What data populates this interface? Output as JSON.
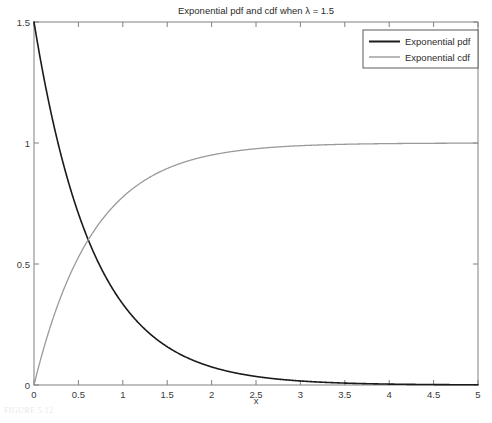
{
  "figure": {
    "caption": "FIGURE 5.12",
    "background_color": "#ffffff"
  },
  "chart_data": {
    "type": "line",
    "title": "Exponential pdf and cdf when λ = 1.5",
    "xlabel": "x",
    "ylabel": "",
    "xlim": [
      0,
      5
    ],
    "ylim": [
      0,
      1.5
    ],
    "grid": false,
    "legend_position": "top-right",
    "lambda": 1.5,
    "xticks": [
      0,
      0.5,
      1,
      1.5,
      2,
      2.5,
      3,
      3.5,
      4,
      4.5,
      5
    ],
    "xticklabels": [
      "0",
      "0.5",
      "1",
      "1.5",
      "2",
      "2.5",
      "3",
      "3.5",
      "4",
      "4.5",
      "5"
    ],
    "yticks": [
      0,
      0.5,
      1,
      1.5
    ],
    "yticklabels": [
      "0",
      "0.5",
      "1",
      "1.5"
    ],
    "series": [
      {
        "name": "Exponential pdf",
        "color": "#1a1a1a",
        "width": 1.6,
        "formula": "1.5*exp(-1.5*x)",
        "x": [
          0,
          0.25,
          0.5,
          0.75,
          1,
          1.25,
          1.5,
          1.75,
          2,
          2.25,
          2.5,
          2.75,
          3,
          3.25,
          3.5,
          3.75,
          4,
          4.25,
          4.5,
          4.75,
          5
        ],
        "values": [
          1.5,
          1.0307,
          0.7082,
          0.4866,
          0.3347,
          0.23,
          0.1581,
          0.1086,
          0.0747,
          0.0513,
          0.0353,
          0.0242,
          0.0167,
          0.0115,
          0.0079,
          0.0054,
          0.0037,
          0.0025,
          0.0017,
          0.0012,
          0.0008
        ]
      },
      {
        "name": "Exponential cdf",
        "color": "#9a9a9a",
        "width": 1.3,
        "formula": "1-exp(-1.5*x)",
        "x": [
          0,
          0.25,
          0.5,
          0.75,
          1,
          1.25,
          1.5,
          1.75,
          2,
          2.25,
          2.5,
          2.75,
          3,
          3.25,
          3.5,
          3.75,
          4,
          4.25,
          4.5,
          4.75,
          5
        ],
        "values": [
          0,
          0.3127,
          0.5276,
          0.6753,
          0.7769,
          0.8467,
          0.8946,
          0.9276,
          0.9502,
          0.9658,
          0.9765,
          0.9838,
          0.9889,
          0.9924,
          0.9948,
          0.9964,
          0.9975,
          0.9983,
          0.9988,
          0.9992,
          0.9994
        ]
      }
    ],
    "annotations": {
      "crossing_point": {
        "x": 0.65,
        "y": 0.57
      }
    }
  },
  "legend": {
    "entries": [
      {
        "label": "Exponential pdf",
        "color": "#1a1a1a"
      },
      {
        "label": "Exponential cdf",
        "color": "#9a9a9a"
      }
    ]
  }
}
